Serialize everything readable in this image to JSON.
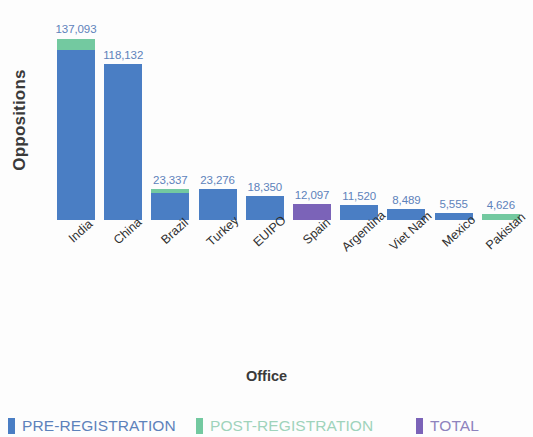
{
  "chart_data": {
    "type": "bar",
    "title": "",
    "subtitle": "",
    "xlabel": "Office",
    "ylabel": "Oppositions",
    "grid": false,
    "legend_position": "bottom",
    "ylim": [
      0,
      145000
    ],
    "stacked": true,
    "categories": [
      "India",
      "China",
      "Brazil",
      "Turkey",
      "EUIPO",
      "Spain",
      "Argentina",
      "Viet Nam",
      "Mexico",
      "Pakistan"
    ],
    "value_labels": [
      "137,093",
      "118,132",
      "23,337",
      "23,276",
      "18,350",
      "12,097",
      "11,520",
      "8,489",
      "5,555",
      "4,626"
    ],
    "values": [
      137093,
      118132,
      23337,
      23276,
      18350,
      12097,
      11520,
      8489,
      5555,
      4626
    ],
    "series": [
      {
        "name": "PRE-REGISTRATION",
        "color": "#4a7ec4",
        "values": [
          128600,
          118132,
          20100,
          23276,
          18350,
          0,
          11520,
          8489,
          5555,
          0
        ]
      },
      {
        "name": "POST-REGISTRATION",
        "color": "#73c9a0",
        "values": [
          8493,
          0,
          3237,
          0,
          0,
          0,
          0,
          0,
          0,
          4626
        ]
      },
      {
        "name": "TOTAL",
        "color": "#7b63b8",
        "values": [
          0,
          0,
          0,
          0,
          0,
          12097,
          0,
          0,
          0,
          0
        ]
      }
    ],
    "bars": [
      {
        "category": "India",
        "label": "137,093",
        "total": 137093,
        "segments": [
          {
            "series": "PRE-REGISTRATION",
            "value": 128600
          },
          {
            "series": "POST-REGISTRATION",
            "value": 8493
          }
        ]
      },
      {
        "category": "China",
        "label": "118,132",
        "total": 118132,
        "segments": [
          {
            "series": "PRE-REGISTRATION",
            "value": 118132
          }
        ]
      },
      {
        "category": "Brazil",
        "label": "23,337",
        "total": 23337,
        "segments": [
          {
            "series": "PRE-REGISTRATION",
            "value": 20100
          },
          {
            "series": "POST-REGISTRATION",
            "value": 3237
          }
        ]
      },
      {
        "category": "Turkey",
        "label": "23,276",
        "total": 23276,
        "segments": [
          {
            "series": "PRE-REGISTRATION",
            "value": 23276
          }
        ]
      },
      {
        "category": "EUIPO",
        "label": "18,350",
        "total": 18350,
        "segments": [
          {
            "series": "PRE-REGISTRATION",
            "value": 18350
          }
        ]
      },
      {
        "category": "Spain",
        "label": "12,097",
        "total": 12097,
        "segments": [
          {
            "series": "TOTAL",
            "value": 12097
          }
        ]
      },
      {
        "category": "Argentina",
        "label": "11,520",
        "total": 11520,
        "segments": [
          {
            "series": "PRE-REGISTRATION",
            "value": 11520
          }
        ]
      },
      {
        "category": "Viet Nam",
        "label": "8,489",
        "total": 8489,
        "segments": [
          {
            "series": "PRE-REGISTRATION",
            "value": 8489
          }
        ]
      },
      {
        "category": "Mexico",
        "label": "5,555",
        "total": 5555,
        "segments": [
          {
            "series": "PRE-REGISTRATION",
            "value": 5555
          }
        ]
      },
      {
        "category": "Pakistan",
        "label": "4,626",
        "total": 4626,
        "segments": [
          {
            "series": "POST-REGISTRATION",
            "value": 4626
          }
        ]
      }
    ],
    "legend": [
      {
        "label": "PRE-REGISTRATION",
        "color": "#4a7ec4",
        "key": "pre"
      },
      {
        "label": "POST-REGISTRATION",
        "color": "#73c9a0",
        "key": "post"
      },
      {
        "label": "TOTAL",
        "color": "#7b63b8",
        "key": "total"
      }
    ]
  }
}
